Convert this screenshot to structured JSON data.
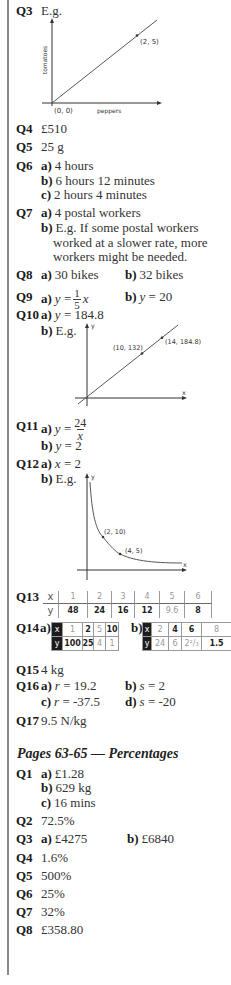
{
  "q3": {
    "label": "Q3",
    "text": "E.g.",
    "graph": {
      "y_axis_label": "tomatoes",
      "x_axis_label": "peppers",
      "origin_label": "(0, 0)",
      "point_label": "(2, 5)"
    }
  },
  "q4": {
    "label": "Q4",
    "text": "£510"
  },
  "q5": {
    "label": "Q5",
    "text": "25 g"
  },
  "q6": {
    "label": "Q6",
    "parts": [
      {
        "letter": "a)",
        "text": "4 hours"
      },
      {
        "letter": "b)",
        "text": "6 hours 12 minutes"
      },
      {
        "letter": "c)",
        "text": "2 hours 4 minutes"
      }
    ]
  },
  "q7": {
    "label": "Q7",
    "parts": [
      {
        "letter": "a)",
        "text": "4 postal workers"
      },
      {
        "letter": "b)",
        "lines": [
          "E.g. If some postal workers",
          "worked at a slower rate, more",
          "workers might be needed."
        ]
      }
    ]
  },
  "q8": {
    "label": "Q8",
    "parts": [
      {
        "letter": "a)",
        "text": "30 bikes"
      },
      {
        "letter": "b)",
        "text": "32 bikes"
      }
    ]
  },
  "q9": {
    "label": "Q9",
    "parts": [
      {
        "letter": "a)",
        "var": "y",
        "eq": "=",
        "numerator": "1",
        "denominator": "5",
        "rhs": "x"
      },
      {
        "letter": "b)",
        "var": "y",
        "eq": "= 20"
      }
    ]
  },
  "q10": {
    "label": "Q10",
    "parts": [
      {
        "letter": "a)",
        "var": "y",
        "eq": "= 184.8"
      },
      {
        "letter": "b)",
        "text": "E.g."
      }
    ],
    "graph": {
      "y_axis_label": "y",
      "x_axis_label": "x",
      "point1_label": "(10, 132)",
      "point2_label": "(14, 184.8)"
    }
  },
  "q11": {
    "label": "Q11",
    "parts": [
      {
        "letter": "a)",
        "var": "y",
        "eq": "=",
        "numerator": "24",
        "denominator": "x"
      },
      {
        "letter": "b)",
        "var": "y",
        "eq": "= 2"
      }
    ]
  },
  "q12": {
    "label": "Q12",
    "parts": [
      {
        "letter": "a)",
        "var": "x",
        "eq": "= 2"
      },
      {
        "letter": "b)",
        "text": "E.g."
      }
    ],
    "graph": {
      "y_axis_label": "y",
      "x_axis_label": "x",
      "point1_label": "(2, 10)",
      "point2_label": "(4, 5)"
    }
  },
  "q13": {
    "label": "Q13",
    "table": {
      "x_header": "x",
      "y_header": "y",
      "x": [
        "1",
        "2",
        "3",
        "4",
        "5",
        "6"
      ],
      "y": [
        "48",
        "24",
        "16",
        "12",
        "9.6",
        "8"
      ]
    }
  },
  "q14": {
    "label": "Q14",
    "a": {
      "letter": "a)",
      "x_header": "x",
      "y_header": "y",
      "x": [
        "1",
        "2",
        "5",
        "10"
      ],
      "y": [
        "100",
        "25",
        "4",
        "1"
      ]
    },
    "b": {
      "letter": "b)",
      "x_header": "x",
      "y_header": "y",
      "x": [
        "2",
        "4",
        "6",
        "8"
      ],
      "y": [
        "24",
        "6",
        "2²/₃",
        "1.5"
      ]
    }
  },
  "q15": {
    "label": "Q15",
    "text": "4 kg"
  },
  "q16": {
    "label": "Q16",
    "parts": [
      {
        "letter": "a)",
        "var": "r",
        "eq": "= 19.2"
      },
      {
        "letter": "b)",
        "var": "s",
        "eq": "= 2"
      },
      {
        "letter": "c)",
        "var": "r",
        "eq": "= -37.5"
      },
      {
        "letter": "d)",
        "var": "s",
        "eq": "= -20"
      }
    ]
  },
  "q17": {
    "label": "Q17",
    "text": "9.5 N/kg"
  },
  "percentages": {
    "heading": "Pages 63-65 — Percentages",
    "q1": {
      "label": "Q1",
      "parts": [
        {
          "letter": "a)",
          "text": "£1.28"
        },
        {
          "letter": "b)",
          "text": "629 kg"
        },
        {
          "letter": "c)",
          "text": "16 mins"
        }
      ]
    },
    "q2": {
      "label": "Q2",
      "text": "72.5%"
    },
    "q3": {
      "label": "Q3",
      "parts": [
        {
          "letter": "a)",
          "text": "£4275"
        },
        {
          "letter": "b)",
          "text": "£6840"
        }
      ]
    },
    "q4": {
      "label": "Q4",
      "text": "1.6%"
    },
    "q5": {
      "label": "Q5",
      "text": "500%"
    },
    "q6": {
      "label": "Q6",
      "text": "25%"
    },
    "q7": {
      "label": "Q7",
      "text": "32%"
    },
    "q8": {
      "label": "Q8",
      "text": "£358.80"
    }
  }
}
